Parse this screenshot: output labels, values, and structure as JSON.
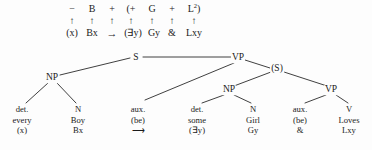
{
  "formula": {
    "upper_row": [
      {
        "label": "−",
        "x": 72
      },
      {
        "label": "B",
        "x": 92
      },
      {
        "label": "+",
        "x": 112
      },
      {
        "label": "(+",
        "x": 131
      },
      {
        "label": "G",
        "x": 152
      },
      {
        "label": "+",
        "x": 172
      },
      {
        "label": "L²)",
        "x": 194
      }
    ],
    "arrows": {
      "glyph": "↑",
      "x_positions": [
        72,
        92,
        112,
        131,
        152,
        172,
        194
      ],
      "y": 21
    },
    "lower_row": [
      {
        "label": "(x)",
        "x": 72
      },
      {
        "label": "Bx",
        "x": 92
      },
      {
        "label": "→",
        "x": 112
      },
      {
        "label": "(∃y)",
        "x": 133
      },
      {
        "label": "Gy",
        "x": 154
      },
      {
        "label": "&",
        "x": 172
      },
      {
        "label": "Lxy",
        "x": 194
      }
    ]
  },
  "tree": {
    "nodes": [
      {
        "id": "S",
        "label": "S",
        "x": 136,
        "y": 58
      },
      {
        "id": "NP1",
        "label": "NP",
        "x": 52,
        "y": 78
      },
      {
        "id": "VP1",
        "label": "VP",
        "x": 238,
        "y": 58
      },
      {
        "id": "S2",
        "label": "(S)",
        "x": 277,
        "y": 69
      },
      {
        "id": "NP2",
        "label": "NP",
        "x": 229,
        "y": 90
      },
      {
        "id": "VP2",
        "label": "VP",
        "x": 331,
        "y": 90
      }
    ],
    "edges": [
      {
        "from": "NP1",
        "to": "S"
      },
      {
        "from": "S",
        "to": "VP1"
      },
      {
        "from": "VP1",
        "to": "S2"
      },
      {
        "from": "VP1",
        "to": "aux1"
      },
      {
        "from": "S2",
        "to": "NP2"
      },
      {
        "from": "S2",
        "to": "VP2"
      },
      {
        "from": "NP1",
        "to": "det1"
      },
      {
        "from": "NP1",
        "to": "N1"
      },
      {
        "from": "NP2",
        "to": "det2"
      },
      {
        "from": "NP2",
        "to": "N2"
      },
      {
        "from": "VP2",
        "to": "aux2"
      },
      {
        "from": "VP2",
        "to": "V1"
      }
    ],
    "leaves": [
      {
        "id": "det1",
        "x": 22,
        "y": 108,
        "cat": "det.",
        "word": "every",
        "logic": "(x)"
      },
      {
        "id": "N1",
        "x": 78,
        "y": 108,
        "cat": "N",
        "word": "Boy",
        "logic": "Bx"
      },
      {
        "id": "aux1",
        "x": 138,
        "y": 108,
        "cat": "aux.",
        "word": "(be)",
        "logic": "⟶"
      },
      {
        "id": "det2",
        "x": 197,
        "y": 108,
        "cat": "det.",
        "word": "some",
        "logic": "(∃y)"
      },
      {
        "id": "N2",
        "x": 253,
        "y": 108,
        "cat": "N",
        "word": "Girl",
        "logic": "Gy"
      },
      {
        "id": "aux2",
        "x": 300,
        "y": 108,
        "cat": "aux.",
        "word": "(be)",
        "logic": "&"
      },
      {
        "id": "V1",
        "x": 349,
        "y": 108,
        "cat": "V",
        "word": "Loves",
        "logic": "Lxy"
      }
    ]
  },
  "colors": {
    "ink": "#1b1b1b",
    "background": "#fdfdfd"
  }
}
